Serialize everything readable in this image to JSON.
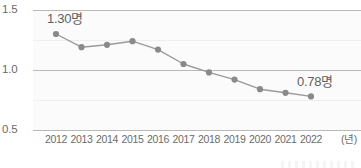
{
  "chart_data": {
    "type": "line",
    "title": "",
    "subtitle": "",
    "xlabel": "(년)",
    "ylabel": "",
    "categories": [
      "2012",
      "2013",
      "2014",
      "2015",
      "2016",
      "2017",
      "2018",
      "2019",
      "2020",
      "2021",
      "2022"
    ],
    "values": [
      1.3,
      1.19,
      1.21,
      1.24,
      1.17,
      1.05,
      0.98,
      0.92,
      0.84,
      0.81,
      0.78
    ],
    "series": [
      {
        "name": "합계출산율",
        "values": [
          1.3,
          1.19,
          1.21,
          1.24,
          1.17,
          1.05,
          0.98,
          0.92,
          0.84,
          0.81,
          0.78
        ]
      }
    ],
    "ylim": [
      0.5,
      1.5
    ],
    "yticks": [
      "0.5",
      "1.0",
      "1.5"
    ],
    "ytick_values": [
      0.5,
      1.0,
      1.5
    ],
    "minor_gridline_values": [
      0.75,
      1.25
    ],
    "grid": true,
    "legend": "none",
    "unit_suffix": "명",
    "annotations": [
      {
        "category": "2012",
        "value": 1.3,
        "text": "1.30명"
      },
      {
        "category": "2022",
        "value": 0.78,
        "text": "0.78명"
      }
    ],
    "colors": {
      "line": "#9a9a9a",
      "marker": "#8a8a8a",
      "major_gridline": "#b9b9b9",
      "minor_gridline": "#f0eef0",
      "plot_background": "#fbfbfb",
      "page_background": "#ffffff",
      "tick_label": "#6b6b6b",
      "annotation_label": "#5f5f5f"
    }
  },
  "axis": {
    "y_labels": [
      "1.5",
      "1.0",
      "0.5"
    ],
    "x_labels": [
      "2012",
      "2013",
      "2014",
      "2015",
      "2016",
      "2017",
      "2018",
      "2019",
      "2020",
      "2021",
      "2022"
    ],
    "x_unit_label": "(년)"
  },
  "labels": {
    "first_point": "1.30명",
    "last_point": "0.78명"
  }
}
